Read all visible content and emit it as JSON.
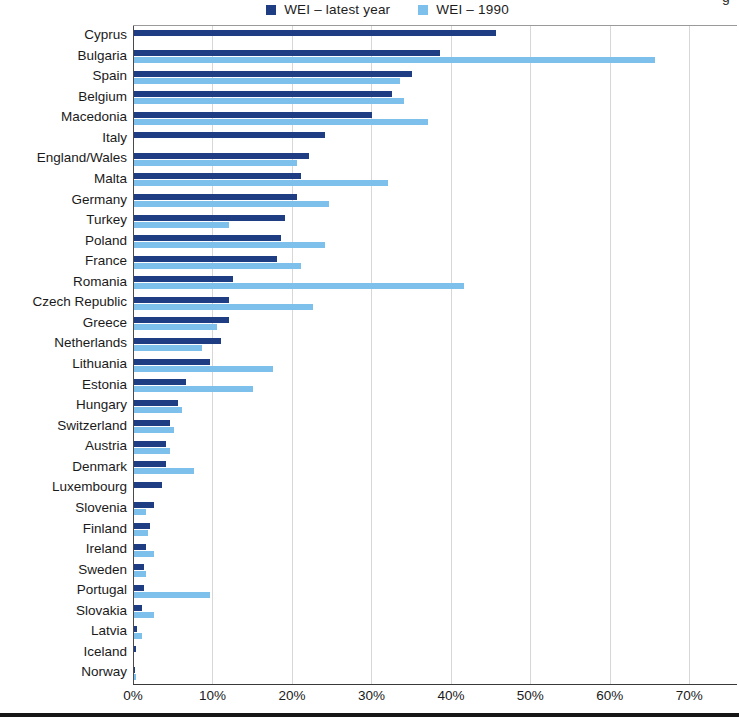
{
  "page": {
    "cropped_fragment": "g"
  },
  "legend": {
    "items": [
      {
        "label": "WEI – latest year",
        "color": "#1e3d82"
      },
      {
        "label": "WEI – 1990",
        "color": "#7ec0ec"
      }
    ]
  },
  "axis": {
    "tick_labels": [
      "0%",
      "10%",
      "20%",
      "30%",
      "40%",
      "50%",
      "60%",
      "70%"
    ],
    "tick_values": [
      0,
      10,
      20,
      30,
      40,
      50,
      60,
      70
    ]
  },
  "chart_data": {
    "type": "bar",
    "orientation": "horizontal",
    "title": "",
    "xlabel": "",
    "ylabel": "",
    "xlim": [
      0,
      76
    ],
    "grid": "vertical gridlines every 10%",
    "legend_position": "top-center",
    "categories": [
      "Cyprus",
      "Bulgaria",
      "Spain",
      "Belgium",
      "Macedonia",
      "Italy",
      "England/Wales",
      "Malta",
      "Germany",
      "Turkey",
      "Poland",
      "France",
      "Romania",
      "Czech Republic",
      "Greece",
      "Netherlands",
      "Lithuania",
      "Estonia",
      "Hungary",
      "Switzerland",
      "Austria",
      "Denmark",
      "Luxembourg",
      "Slovenia",
      "Finland",
      "Ireland",
      "Sweden",
      "Portugal",
      "Slovakia",
      "Latvia",
      "Iceland",
      "Norway"
    ],
    "series": [
      {
        "name": "WEI – latest year",
        "color": "#1e3d82",
        "values": [
          45.5,
          38.5,
          35,
          32.5,
          30,
          24,
          22,
          21,
          20.5,
          19,
          18.5,
          18,
          12.5,
          12,
          12,
          11,
          9.5,
          6.5,
          5.5,
          4.5,
          4,
          4,
          3.5,
          2.5,
          2,
          1.5,
          1.2,
          1.2,
          1,
          0.4,
          0.3,
          0.1
        ]
      },
      {
        "name": "WEI – 1990",
        "color": "#7ec0ec",
        "values": [
          null,
          65.5,
          33.5,
          34,
          37,
          null,
          20.5,
          32,
          24.5,
          12,
          24,
          21,
          41.5,
          22.5,
          10.5,
          8.5,
          17.5,
          15,
          6,
          5,
          4.5,
          7.5,
          null,
          1.5,
          1.8,
          2.5,
          1.5,
          9.5,
          2.5,
          1,
          null,
          0.2
        ]
      }
    ]
  },
  "colors": {
    "series_latest": "#1e3d82",
    "series_1990": "#7ec0ec",
    "gridline": "#d7d7d7",
    "axis_line": "#4a4a4a",
    "text": "#1a1a1a",
    "bottom_rule": "#161616"
  }
}
